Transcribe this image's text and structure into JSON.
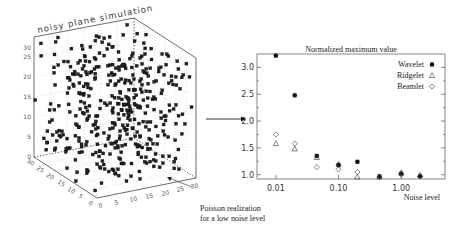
{
  "left_panel": {
    "title": "noisy plane simulation",
    "z_ticks": [
      "0",
      "5",
      "10",
      "15",
      "20",
      "25",
      "30"
    ],
    "x_ticks": [
      "0",
      "5",
      "10",
      "15",
      "20",
      "25",
      "30"
    ],
    "y_ticks": [
      "0",
      "5",
      "10",
      "15",
      "20",
      "25",
      "30"
    ],
    "annotation_line1": "Poisson realization",
    "annotation_line2": "for a low noise level"
  },
  "chart_data": {
    "type": "scatter",
    "title": "Normalized maximum value",
    "xlabel": "Noise level",
    "ylabel": "",
    "xscale": "log",
    "x_tick_labels": [
      "0.01",
      "0.10",
      "1.00"
    ],
    "y_tick_labels": [
      "1.0",
      "1.5",
      "2.0",
      "2.5",
      "3.0"
    ],
    "ylim": [
      0.92,
      3.25
    ],
    "xlim": [
      0.005,
      5.0
    ],
    "grid": false,
    "legend_position": "upper right",
    "x": [
      0.01,
      0.02,
      0.045,
      0.1,
      0.2,
      0.45,
      1.0,
      2.0
    ],
    "series": [
      {
        "name": "Wavelet",
        "marker": "asterisk",
        "values": [
          3.22,
          2.48,
          1.35,
          1.18,
          1.24,
          0.97,
          1.02,
          0.97
        ]
      },
      {
        "name": "Ridgelet",
        "marker": "triangle",
        "values": [
          1.58,
          1.48,
          1.32,
          1.2,
          0.96,
          0.96,
          1.04,
          0.99
        ]
      },
      {
        "name": "Beamlet",
        "marker": "diamond",
        "values": [
          1.75,
          1.58,
          1.14,
          1.1,
          1.05,
          0.95,
          1.0,
          0.97
        ]
      }
    ]
  }
}
